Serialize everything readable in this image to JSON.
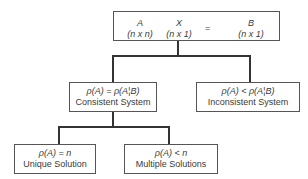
{
  "diagram": {
    "root": {
      "terms": [
        {
          "symbol": "A",
          "dims": "(n x n)"
        },
        {
          "symbol": "X",
          "dims": "(n x 1)"
        },
        {
          "symbol": "B",
          "dims": "(n x 1)"
        }
      ],
      "operator": "="
    },
    "consistent": {
      "condition": "ρ(A) = ρ(A¦B)",
      "label": "Consistent System"
    },
    "inconsistent": {
      "condition": "ρ(A) < ρ(A¦B)",
      "label": "Inconsistent System"
    },
    "unique": {
      "condition": "ρ(A) = n",
      "label": "Unique Solution"
    },
    "multiple": {
      "condition": "ρ(A) < n",
      "label": "Multiple Solutions"
    }
  }
}
